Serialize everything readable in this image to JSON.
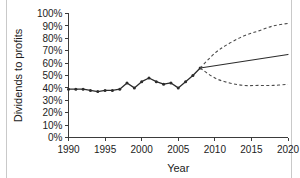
{
  "chart_data": {
    "type": "line",
    "title": "",
    "xlabel": "Year",
    "ylabel": "Dividends to profits",
    "xlim": [
      1990,
      2020
    ],
    "ylim": [
      0,
      100
    ],
    "grid": false,
    "legend": "none",
    "x_ticks": [
      1990,
      1995,
      2000,
      2005,
      2010,
      2015,
      2020
    ],
    "x_tick_labels": [
      "1990",
      "1995",
      "2000",
      "2005",
      "2010",
      "2015",
      "2020"
    ],
    "y_ticks": [
      0,
      10,
      20,
      30,
      40,
      50,
      60,
      70,
      80,
      90,
      100
    ],
    "y_tick_labels": [
      "0%",
      "10%",
      "20%",
      "30%",
      "40%",
      "50%",
      "60%",
      "70%",
      "80%",
      "90%",
      "100%"
    ],
    "series": [
      {
        "name": "Historical dividends to profits",
        "style": "solid-with-markers",
        "x": [
          1990,
          1991,
          1992,
          1993,
          1994,
          1995,
          1996,
          1997,
          1998,
          1999,
          2000,
          2001,
          2002,
          2003,
          2004,
          2005,
          2006,
          2007,
          2008
        ],
        "values": [
          39,
          39,
          39,
          38,
          37,
          38,
          38,
          39,
          44,
          40,
          45,
          48,
          45,
          43,
          44,
          40,
          45,
          50,
          56
        ]
      },
      {
        "name": "Central projection",
        "style": "solid",
        "x": [
          2008,
          2020
        ],
        "values": [
          56,
          67
        ]
      },
      {
        "name": "Upper bound projection",
        "style": "dashed",
        "x": [
          2008,
          2010,
          2012,
          2014,
          2016,
          2018,
          2020
        ],
        "values": [
          56,
          68,
          76,
          82,
          86,
          90,
          92
        ]
      },
      {
        "name": "Lower bound projection",
        "style": "dashed",
        "x": [
          2008,
          2010,
          2012,
          2014,
          2016,
          2018,
          2020
        ],
        "values": [
          56,
          48,
          44,
          42,
          42,
          42,
          43
        ]
      }
    ]
  },
  "colors": {
    "line": "#2b2b2b",
    "band": "#4a4a4a",
    "axis": "#3b3b3b",
    "text": "#1c1c1c",
    "background": "#ffffff"
  }
}
